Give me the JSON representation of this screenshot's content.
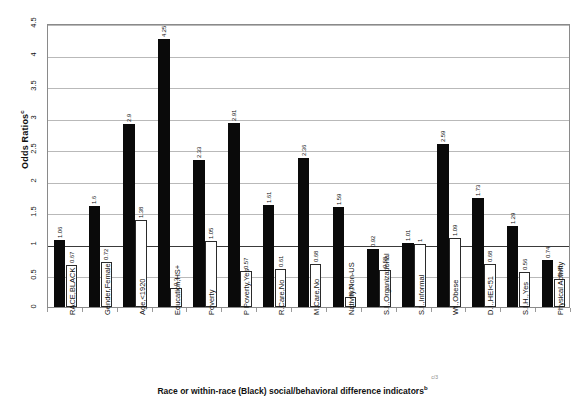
{
  "chart_data": {
    "type": "bar",
    "title": "",
    "subtitle": "",
    "xlabel": "Race or within-race (Black) social/behavioral difference indicators",
    "xlabel_superscript": "b",
    "ylabel": "Odds Ratios",
    "ylabel_superscript": "c",
    "ylim": [
      0,
      4.5
    ],
    "ytick_values": [
      0,
      0.5,
      1,
      1.5,
      2,
      2.5,
      3,
      3.5,
      4,
      4.5
    ],
    "ytick_labels": [
      "0",
      "0.5",
      "1",
      "1.5",
      "2",
      "2.5",
      "3",
      "3.5",
      "4",
      "4.5"
    ],
    "grid": true,
    "reference_line": 1,
    "legend_position": "none",
    "categories": [
      "RACE,BLACK",
      "Gender,Female",
      "Age,<1920",
      "Education,HS+",
      "Poverty",
      "P Poverty,Yes",
      "R.Care,No",
      "M.Care,No",
      "Nativity,Non-US",
      "S.I.,Organizational",
      "S.I.,Informal",
      "Wt.,Obese",
      "D.I.,HEI<51",
      "S.I.H.,Yes",
      "Physical Activity"
    ],
    "series": [
      {
        "name": "series-black",
        "fill": "#0a0a0a",
        "values": [
          1.06,
          1.6,
          2.9,
          4.25,
          2.33,
          2.91,
          1.61,
          2.36,
          1.59,
          0.92,
          1.01,
          2.59,
          1.73,
          1.29,
          0.74
        ]
      },
      {
        "name": "series-white",
        "fill": "#ffffff",
        "values": [
          0.67,
          0.72,
          1.38,
          0.3,
          1.05,
          0.57,
          0.61,
          0.68,
          0.16,
          0.58,
          1,
          1.09,
          0.68,
          0.56,
          0.45
        ]
      }
    ]
  }
}
